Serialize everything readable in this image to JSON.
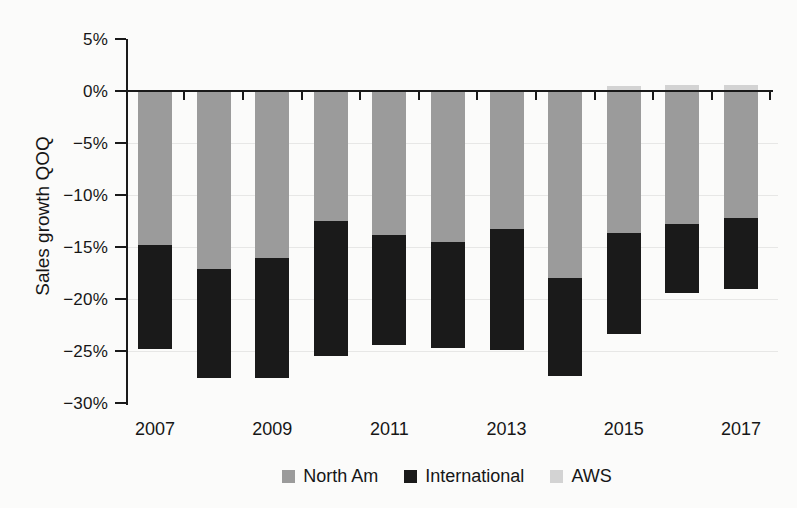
{
  "figure": {
    "background": "#fbfbfa"
  },
  "chart_data": {
    "type": "bar",
    "stacked": true,
    "title": "",
    "xlabel": "",
    "ylabel": "Sales growth QOQ",
    "ylim": [
      -30,
      5
    ],
    "grid": "faint-horizontal",
    "legend_position": "bottom",
    "axis_color": "#1a1a1a",
    "grid_color": "rgba(0,0,0,0.08)",
    "ytick_values": [
      5,
      0,
      -5,
      -10,
      -15,
      -20,
      -25,
      -30
    ],
    "ytick_labels": [
      "5%",
      "0%",
      "−5%",
      "−10%",
      "−15%",
      "−20%",
      "−25%",
      "−30%"
    ],
    "categories": [
      "2007",
      "2008",
      "2009",
      "2010",
      "2011",
      "2012",
      "2013",
      "2014",
      "2015",
      "2016",
      "2017"
    ],
    "xtick_labels": [
      "2007",
      "2009",
      "2011",
      "2013",
      "2015",
      "2017"
    ],
    "xtick_label_category_indices": [
      0,
      2,
      4,
      6,
      8,
      10
    ],
    "series": [
      {
        "name": "North Am",
        "color": "#9b9b9b",
        "values": [
          -14.8,
          -17.1,
          -16.1,
          -12.5,
          -13.8,
          -14.5,
          -13.3,
          -18.0,
          -13.7,
          -12.8,
          -12.2
        ]
      },
      {
        "name": "International",
        "color": "#1a1a1a",
        "values": [
          -10.0,
          -10.5,
          -11.5,
          -13.0,
          -10.6,
          -10.2,
          -11.6,
          -9.4,
          -9.7,
          -6.6,
          -6.8
        ]
      },
      {
        "name": "AWS",
        "color": "#d3d3d3",
        "values": [
          0,
          0,
          0,
          0,
          0,
          0,
          0,
          0,
          0.5,
          0.6,
          0.6
        ]
      }
    ]
  }
}
